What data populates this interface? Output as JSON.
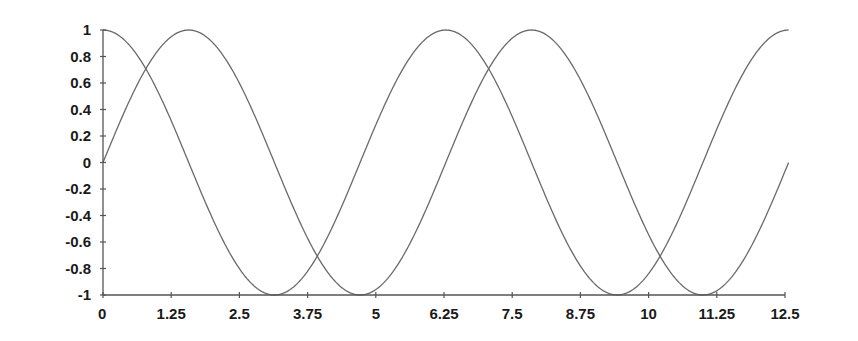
{
  "chart_data": {
    "type": "line",
    "title": "",
    "xlabel": "",
    "ylabel": "",
    "xlim": [
      0,
      12.5
    ],
    "ylim": [
      -1,
      1
    ],
    "grid": false,
    "legend": null,
    "x_ticks": [
      0,
      1.25,
      2.5,
      3.75,
      5,
      6.25,
      7.5,
      8.75,
      10,
      11.25,
      12.5
    ],
    "x_tick_labels": [
      "0",
      "1.25",
      "2.5",
      "3.75",
      "5",
      "6.25",
      "7.5",
      "8.75",
      "10",
      "11.25",
      "12.5"
    ],
    "y_ticks": [
      1,
      0.8,
      0.6,
      0.4,
      0.2,
      0,
      -0.2,
      -0.4,
      -0.6,
      -0.8,
      -1
    ],
    "y_tick_labels": [
      "1",
      "0.8",
      "0.6",
      "0.4",
      "0.2",
      "0",
      "-0.2",
      "-0.4",
      "-0.6",
      "-0.8",
      "-1"
    ],
    "series": [
      {
        "name": "sin(x)",
        "function": "sin",
        "x_range": [
          0,
          12.566
        ],
        "samples": [
          {
            "x": 0,
            "y": 0
          },
          {
            "x": 1.571,
            "y": 1
          },
          {
            "x": 3.142,
            "y": 0
          },
          {
            "x": 4.712,
            "y": -1
          },
          {
            "x": 6.283,
            "y": 0
          },
          {
            "x": 7.854,
            "y": 1
          },
          {
            "x": 9.425,
            "y": 0
          },
          {
            "x": 10.996,
            "y": -1
          },
          {
            "x": 12.566,
            "y": 0
          }
        ]
      },
      {
        "name": "cos(x)",
        "function": "cos",
        "x_range": [
          0,
          12.566
        ],
        "samples": [
          {
            "x": 0,
            "y": 1
          },
          {
            "x": 1.571,
            "y": 0
          },
          {
            "x": 3.142,
            "y": -1
          },
          {
            "x": 4.712,
            "y": 0
          },
          {
            "x": 6.283,
            "y": 1
          },
          {
            "x": 7.854,
            "y": 0
          },
          {
            "x": 9.425,
            "y": -1
          },
          {
            "x": 10.996,
            "y": 0
          },
          {
            "x": 12.566,
            "y": 1
          }
        ]
      }
    ],
    "colors": {
      "curve": "#6a6a6a",
      "axis": "#555555",
      "text": "#1a1a1a",
      "background": "#ffffff"
    }
  }
}
